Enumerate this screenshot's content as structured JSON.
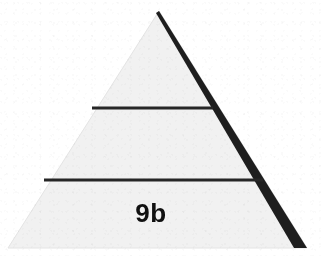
{
  "figure": {
    "caption_label": "9b",
    "shape": "triangle",
    "tier_count": 3,
    "background_color": "#ffffff",
    "fill_color": "#f1f1f1",
    "outline_color": "#1e1e1e",
    "divider_color": "#262626",
    "label_color": "#101010"
  },
  "geometry": {
    "apex": {
      "x": 159,
      "y": 11
    },
    "bottom_left": {
      "x": 8,
      "y": 248
    },
    "bottom_right": {
      "x": 307,
      "y": 248
    },
    "dividers": [
      {
        "name": "upper-divider",
        "y": 108,
        "x_start": 92,
        "x_end": 213
      },
      {
        "name": "lower-divider",
        "y": 180,
        "x_start": 44,
        "x_end": 263
      }
    ],
    "shaded_edge": {
      "name": "right-edge-shadow",
      "width_at_apex": 3,
      "width_at_base": 13
    }
  },
  "tiers": [
    {
      "name": "tier-top",
      "label": ""
    },
    {
      "name": "tier-middle",
      "label": ""
    },
    {
      "name": "tier-bottom",
      "label": "9b"
    }
  ],
  "label_position": {
    "x": 151,
    "y": 222
  }
}
